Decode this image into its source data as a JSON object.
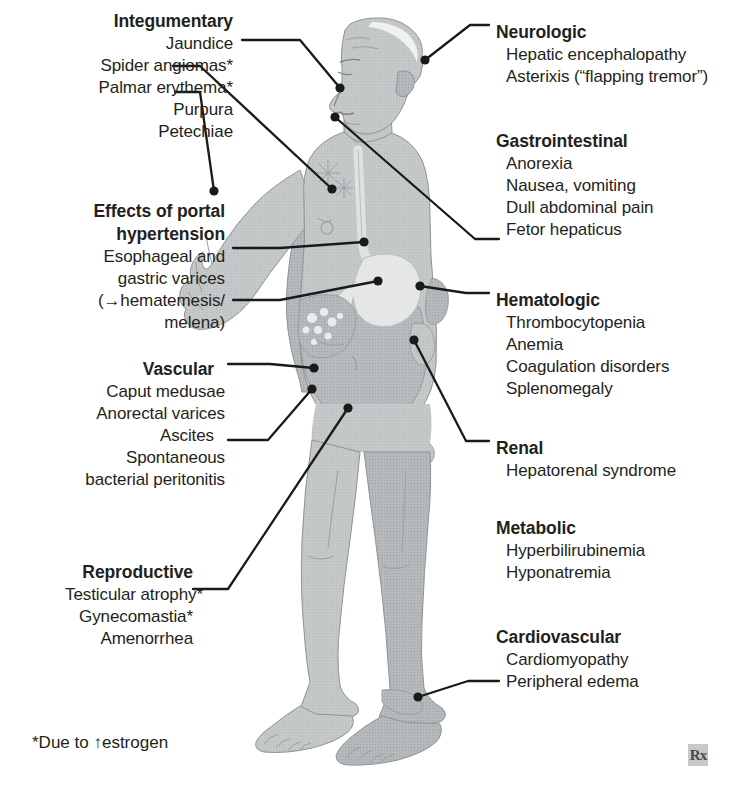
{
  "figure": {
    "footnote": "*Due to ↑estrogen",
    "watermark": "Rx",
    "colors": {
      "text": "#231f20",
      "leader_line": "#1a1a1a",
      "body_fill": "#c3c6c7",
      "body_shade": "#b0b4b6",
      "organ_light": "#e8eaea",
      "outline": "#8f9395",
      "background": "#ffffff"
    }
  },
  "left_groups": [
    {
      "name": "integumentary",
      "heading": "Integumentary",
      "heading_x": 233,
      "heading_y": 10,
      "items": [
        {
          "label": "Jaundice",
          "x": 233,
          "y": 34
        },
        {
          "label": "Spider angiomas*",
          "x": 233,
          "y": 60
        },
        {
          "label": "Palmar erythema*",
          "x": 233,
          "y": 86
        },
        {
          "label": "Purpura",
          "x": 233,
          "y": 112
        },
        {
          "label": "Petechiae",
          "x": 233,
          "y": 137
        }
      ]
    },
    {
      "name": "portal-hypertension",
      "heading": "Effects of portal",
      "heading2": "hypertension",
      "heading_x": 225,
      "heading_y": 200,
      "items": [
        {
          "label": "Esophageal and",
          "x": 225,
          "y": 249
        },
        {
          "label": "gastric varices",
          "x": 225,
          "y": 275
        },
        {
          "label": "(→hematemesis/",
          "x": 225,
          "y": 301
        },
        {
          "label": "melena)",
          "x": 225,
          "y": 327
        }
      ]
    },
    {
      "name": "vascular",
      "heading": "Vascular",
      "heading_x": 220,
      "heading_y": 358,
      "items": [
        {
          "label": "Caput medusae",
          "x": 225,
          "y": 385
        },
        {
          "label": "Anorectal varices",
          "x": 225,
          "y": 411
        },
        {
          "label": "Ascites",
          "x": 220,
          "y": 437
        },
        {
          "label": "Spontaneous",
          "x": 225,
          "y": 463
        },
        {
          "label": "bacterial peritonitis",
          "x": 225,
          "y": 489
        }
      ]
    },
    {
      "name": "reproductive",
      "heading": "Reproductive",
      "heading_x": 193,
      "heading_y": 561,
      "items": [
        {
          "label": "Testicular atrophy*",
          "x": 185,
          "y": 587
        },
        {
          "label": "Gynecomastia*",
          "x": 193,
          "y": 613
        },
        {
          "label": "Amenorrhea",
          "x": 193,
          "y": 639
        }
      ]
    }
  ],
  "right_groups": [
    {
      "name": "neurologic",
      "heading": "Neurologic",
      "heading_x": 496,
      "heading_y": 21,
      "items": [
        {
          "label": "Hepatic encephalopathy",
          "x": 506,
          "y": 46
        },
        {
          "label": "Asterixis (“flapping tremor”)",
          "x": 506,
          "y": 72
        }
      ]
    },
    {
      "name": "gastrointestinal",
      "heading": "Gastrointestinal",
      "heading_x": 496,
      "heading_y": 130,
      "items": [
        {
          "label": "Anorexia",
          "x": 506,
          "y": 156
        },
        {
          "label": "Nausea, vomiting",
          "x": 506,
          "y": 182
        },
        {
          "label": "Dull abdominal pain",
          "x": 506,
          "y": 208
        },
        {
          "label": "Fetor hepaticus",
          "x": 506,
          "y": 234
        }
      ]
    },
    {
      "name": "hematologic",
      "heading": "Hematologic",
      "heading_x": 496,
      "heading_y": 289,
      "items": [
        {
          "label": "Thrombocytopenia",
          "x": 506,
          "y": 315
        },
        {
          "label": "Anemia",
          "x": 506,
          "y": 341
        },
        {
          "label": "Coagulation disorders",
          "x": 506,
          "y": 367
        },
        {
          "label": "Splenomegaly",
          "x": 506,
          "y": 393
        }
      ]
    },
    {
      "name": "renal",
      "heading": "Renal",
      "heading_x": 496,
      "heading_y": 437,
      "items": [
        {
          "label": "Hepatorenal syndrome",
          "x": 506,
          "y": 463
        }
      ]
    },
    {
      "name": "metabolic",
      "heading": "Metabolic",
      "heading_x": 496,
      "heading_y": 517,
      "items": [
        {
          "label": "Hyperbilirubinemia",
          "x": 506,
          "y": 543
        },
        {
          "label": "Hyponatremia",
          "x": 506,
          "y": 569
        }
      ]
    },
    {
      "name": "cardiovascular",
      "heading": "Cardiovascular",
      "heading_x": 496,
      "heading_y": 626,
      "items": [
        {
          "label": "Cardiomyopathy",
          "x": 506,
          "y": 652
        },
        {
          "label": "Peripheral edema",
          "x": 506,
          "y": 678
        }
      ]
    }
  ],
  "leaders": [
    {
      "name": "leader-jaundice",
      "points": "242,40 300,40 340,88",
      "dot": [
        340,
        88
      ]
    },
    {
      "name": "leader-spider-angiomas",
      "points": "173,66 200,66 332,189",
      "dot": [
        332,
        189
      ]
    },
    {
      "name": "leader-palmar-erythema",
      "points": "175,92 200,92 214,191",
      "dot": [
        214,
        191
      ]
    },
    {
      "name": "leader-esophageal-varices",
      "points": "233,248 280,248 364,242",
      "dot": [
        364,
        242
      ]
    },
    {
      "name": "leader-hematemesis",
      "points": "233,300 280,300 378,281",
      "dot": [
        378,
        281
      ]
    },
    {
      "name": "leader-vascular",
      "points": "228,364 270,364 314,368",
      "dot": [
        314,
        368
      ]
    },
    {
      "name": "leader-ascites",
      "points": "228,440 268,440 312,389",
      "dot": [
        312,
        389
      ]
    },
    {
      "name": "leader-testicular-atrophy",
      "points": "193,589 228,589 348,408",
      "dot": [
        348,
        408
      ]
    },
    {
      "name": "leader-neurologic",
      "points": "489,25 470,25 425,60",
      "dot": [
        425,
        60
      ]
    },
    {
      "name": "leader-fetor-hepaticus",
      "points": "499,239 475,239 335,117",
      "dot": [
        335,
        117
      ]
    },
    {
      "name": "leader-hematologic",
      "points": "489,293 466,293 420,286",
      "dot": [
        420,
        286
      ]
    },
    {
      "name": "leader-renal",
      "points": "489,441 466,441 414,340",
      "dot": [
        414,
        340
      ]
    },
    {
      "name": "leader-peripheral-edema",
      "points": "499,681 468,681 418,697",
      "dot": [
        418,
        697
      ]
    }
  ]
}
